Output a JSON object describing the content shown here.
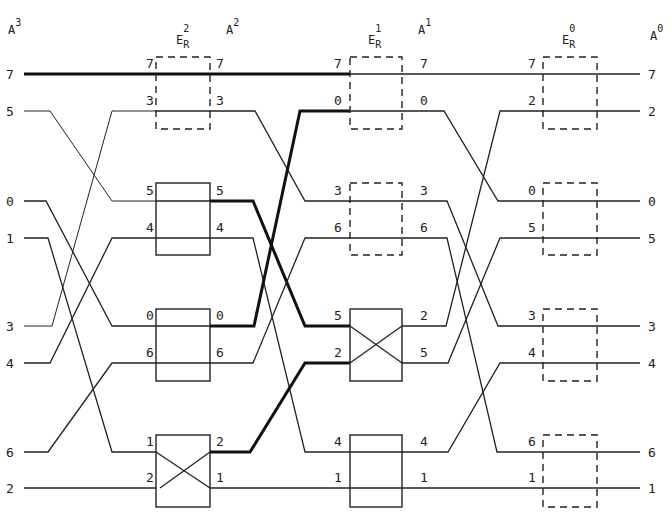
{
  "diagram": {
    "stage_headers": [
      {
        "id": "A3",
        "base": "A",
        "sup": "3",
        "x": 8
      },
      {
        "id": "ER2",
        "base": "E",
        "sub": "R",
        "sup": "2",
        "x": 164
      },
      {
        "id": "A2",
        "base": "A",
        "sup": "2",
        "x": 218
      },
      {
        "id": "ER1",
        "base": "E",
        "sub": "R",
        "sup": "1",
        "x": 358
      },
      {
        "id": "A1",
        "base": "A",
        "sup": "1",
        "x": 418
      },
      {
        "id": "ER0",
        "base": "E",
        "sub": "R",
        "sup": "0",
        "x": 555
      },
      {
        "id": "A0",
        "base": "A",
        "sup": "0",
        "x": 648
      }
    ],
    "stages": {
      "A3": {
        "labels": [
          "7",
          "5",
          "0",
          "1",
          "3",
          "4",
          "6",
          "2"
        ]
      },
      "ER2_in": {
        "labels": [
          "7",
          "3",
          "5",
          "4",
          "0",
          "6",
          "1",
          "2"
        ]
      },
      "A2": {
        "labels": [
          "7",
          "3",
          "5",
          "4",
          "0",
          "6",
          "2",
          "1"
        ]
      },
      "ER1_in": {
        "labels": [
          "7",
          "0",
          "3",
          "6",
          "5",
          "2",
          "4",
          "1"
        ]
      },
      "A1": {
        "labels": [
          "7",
          "0",
          "3",
          "6",
          "2",
          "5",
          "4",
          "1"
        ]
      },
      "ER0_in": {
        "labels": [
          "7",
          "2",
          "0",
          "5",
          "3",
          "4",
          "6",
          "1"
        ]
      },
      "A0": {
        "labels": [
          "7",
          "2",
          "0",
          "5",
          "3",
          "4",
          "6",
          "1"
        ]
      }
    },
    "switches": {
      "ER2": [
        {
          "rows": [
            0,
            1
          ],
          "state": "straight",
          "style": "dashed"
        },
        {
          "rows": [
            2,
            3
          ],
          "state": "straight",
          "style": "solid"
        },
        {
          "rows": [
            4,
            5
          ],
          "state": "straight",
          "style": "solid"
        },
        {
          "rows": [
            6,
            7
          ],
          "state": "cross",
          "style": "solid"
        }
      ],
      "ER1": [
        {
          "rows": [
            0,
            1
          ],
          "state": "straight",
          "style": "dashed"
        },
        {
          "rows": [
            2,
            3
          ],
          "state": "straight",
          "style": "dashed"
        },
        {
          "rows": [
            4,
            5
          ],
          "state": "cross",
          "style": "solid"
        },
        {
          "rows": [
            6,
            7
          ],
          "state": "straight",
          "style": "solid"
        }
      ],
      "ER0": [
        {
          "rows": [
            0,
            1
          ],
          "state": "straight",
          "style": "dashed"
        },
        {
          "rows": [
            2,
            3
          ],
          "state": "straight",
          "style": "dashed"
        },
        {
          "rows": [
            4,
            5
          ],
          "state": "straight",
          "style": "dashed"
        },
        {
          "rows": [
            6,
            7
          ],
          "state": "straight",
          "style": "dashed"
        }
      ]
    },
    "highlighted_paths": [
      {
        "signal": "7",
        "note": "bold from A3 row 7 through E_R2 and into E_R1"
      },
      {
        "signal": "0",
        "note": "bold from E_R2 row 0 to E_R1 row 0"
      },
      {
        "signal": "5",
        "note": "bold from A2 row 5 to E_R1 row 5"
      },
      {
        "signal": "2",
        "note": "bold from A2 row 2 to E_R1 row 2"
      }
    ],
    "colors": {
      "ink": "#222222",
      "background": "#ffffff"
    }
  }
}
